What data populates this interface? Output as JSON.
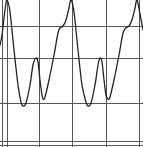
{
  "chart_data": {
    "type": "line",
    "title": "",
    "xlabel": "",
    "ylabel": "",
    "grid": true,
    "legend": null,
    "grid_lines": {
      "vertical_px": [
        2,
        7,
        39,
        72,
        106,
        139
      ],
      "horizontal_px": [
        26,
        58,
        103,
        141,
        145
      ]
    },
    "series": [
      {
        "name": "waveform",
        "color": "#222222",
        "points_px": [
          [
            0,
            45
          ],
          [
            2,
            35
          ],
          [
            5,
            10
          ],
          [
            7,
            0
          ],
          [
            10,
            12
          ],
          [
            14,
            50
          ],
          [
            18,
            85
          ],
          [
            21,
            102
          ],
          [
            23,
            106
          ],
          [
            26,
            103
          ],
          [
            30,
            85
          ],
          [
            33,
            65
          ],
          [
            36,
            58
          ],
          [
            38,
            62
          ],
          [
            40,
            80
          ],
          [
            42,
            95
          ],
          [
            43,
            99
          ],
          [
            45,
            97
          ],
          [
            49,
            80
          ],
          [
            54,
            55
          ],
          [
            58,
            33
          ],
          [
            60,
            28
          ],
          [
            63,
            26
          ],
          [
            66,
            20
          ],
          [
            69,
            8
          ],
          [
            71,
            0
          ],
          [
            74,
            12
          ],
          [
            78,
            50
          ],
          [
            82,
            85
          ],
          [
            86,
            102
          ],
          [
            88,
            106
          ],
          [
            91,
            103
          ],
          [
            95,
            85
          ],
          [
            98,
            65
          ],
          [
            100,
            58
          ],
          [
            102,
            62
          ],
          [
            104,
            80
          ],
          [
            106,
            95
          ],
          [
            108,
            99
          ],
          [
            110,
            97
          ],
          [
            114,
            80
          ],
          [
            119,
            55
          ],
          [
            123,
            33
          ],
          [
            126,
            28
          ],
          [
            129,
            26
          ],
          [
            132,
            20
          ],
          [
            135,
            8
          ],
          [
            137,
            0
          ],
          [
            140,
            14
          ],
          [
            143,
            30
          ]
        ]
      }
    ]
  }
}
